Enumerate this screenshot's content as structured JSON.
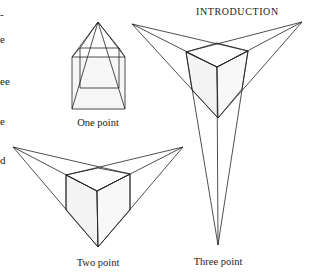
{
  "page": {
    "running_header": "INTRODUCTION",
    "margin_text_fragments": [
      "-",
      "e",
      "ee",
      "e",
      "d"
    ]
  },
  "figures": [
    {
      "id": "one-point",
      "caption": "One point"
    },
    {
      "id": "two-point",
      "caption": "Two point"
    },
    {
      "id": "three-point",
      "caption": "Three point"
    }
  ],
  "colors": {
    "line": "#222222",
    "fill": "#f4f4f4",
    "background": "#ffffff"
  }
}
